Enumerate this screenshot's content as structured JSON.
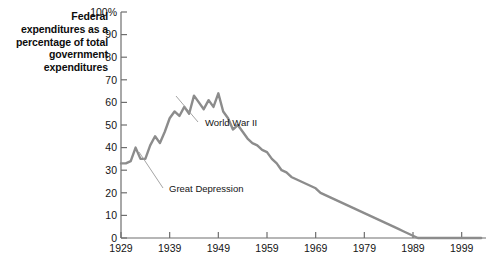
{
  "chart_data": {
    "type": "line",
    "title": "",
    "ylabel": "Federal expenditures as a percentage of total government expenditures",
    "xlabel": "",
    "ylim": [
      0,
      100
    ],
    "xlim": [
      1929,
      2004
    ],
    "grid": false,
    "legend": null,
    "y_tick_labels": [
      "100%",
      "90",
      "80",
      "70",
      "60",
      "50",
      "40",
      "30",
      "20",
      "10",
      "0"
    ],
    "y_ticks": [
      100,
      90,
      80,
      70,
      60,
      50,
      40,
      30,
      20,
      10,
      0
    ],
    "x_tick_labels": [
      "1929",
      "1939",
      "1949",
      "1959",
      "1969",
      "1979",
      "1989",
      "1999"
    ],
    "x_ticks": [
      1929,
      1939,
      1949,
      1959,
      1969,
      1979,
      1989,
      1999
    ],
    "series": [
      {
        "name": "Federal share of total government expenditures",
        "color": "#8c8c8c",
        "x": [
          1929,
          1930,
          1931,
          1932,
          1933,
          1934,
          1935,
          1936,
          1937,
          1938,
          1939,
          1940,
          1941,
          1942,
          1943,
          1944,
          1945,
          1946,
          1947,
          1948,
          1949,
          1950,
          1951,
          1952,
          1953,
          1954,
          1955,
          1956,
          1957,
          1958,
          1959,
          1960,
          1961,
          1962,
          1963,
          1964,
          1965,
          1966,
          1967,
          1968,
          1969,
          1970,
          1971,
          1972,
          1973,
          1974,
          1975,
          1976,
          1977,
          1978,
          1979,
          1980,
          1981,
          1982,
          1983,
          1984,
          1985,
          1986,
          1987,
          1988,
          1989,
          1990,
          1991,
          1992,
          1993,
          1994,
          1995,
          1996,
          1997,
          1998,
          1999,
          2000,
          2001,
          2002,
          2003
        ],
        "values": [
          33,
          33,
          34,
          40,
          35,
          35,
          41,
          45,
          42,
          47,
          53,
          56,
          54,
          58,
          55,
          63,
          60,
          57,
          61,
          58,
          64,
          56,
          53,
          48,
          50,
          47,
          44,
          42,
          41,
          39,
          38,
          35,
          33,
          30,
          29,
          27,
          26,
          25,
          24,
          23,
          22,
          20,
          19,
          18,
          17,
          16,
          15,
          14,
          13,
          12,
          11,
          10,
          9,
          8,
          7,
          6,
          5,
          4,
          3,
          2,
          1,
          0,
          0,
          0,
          0,
          0,
          0,
          0,
          0,
          0,
          0,
          0,
          0,
          0,
          0
        ]
      }
    ],
    "annotations": [
      {
        "text": "World War II",
        "x": 205,
        "y": 126,
        "line_from": [
          198,
          122
        ],
        "line_to": [
          176,
          96
        ]
      },
      {
        "text": "Great Depression",
        "x": 169,
        "y": 192,
        "line_from": [
          163,
          188
        ],
        "line_to": [
          139,
          152
        ]
      }
    ]
  },
  "axis_title": {
    "text": "Federal expenditures as a percentage of total government expenditures"
  },
  "colors": {
    "line": "#8c8c8c",
    "axis": "#6e6e6e",
    "text": "#141414"
  }
}
